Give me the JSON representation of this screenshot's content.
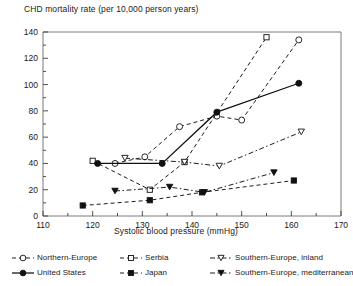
{
  "chart_data": {
    "type": "line",
    "title": "CHD mortality rate (per 10,000 person years)",
    "xlabel": "Systolic blood pressure (mmHg)",
    "ylabel": "CHD mortality rate (per 10,000 person years)",
    "xlim": [
      110,
      170
    ],
    "ylim": [
      0,
      140
    ],
    "xticks": [
      110,
      120,
      130,
      140,
      150,
      160,
      170
    ],
    "yticks": [
      0,
      20,
      40,
      60,
      80,
      100,
      120,
      140
    ],
    "x_minor_step": 5,
    "y_minor_step": 10,
    "grid": false,
    "legend_position": "bottom",
    "legend_columns": 3,
    "series": [
      {
        "name": "Northern-Europe",
        "marker": "open-circle",
        "line": "dashed",
        "points": [
          {
            "x": 124.5,
            "y": 40
          },
          {
            "x": 130.5,
            "y": 45
          },
          {
            "x": 137.5,
            "y": 68
          },
          {
            "x": 145.0,
            "y": 76
          },
          {
            "x": 150.0,
            "y": 73
          },
          {
            "x": 161.5,
            "y": 134
          }
        ]
      },
      {
        "name": "Serbia",
        "marker": "open-square",
        "line": "dashed",
        "points": [
          {
            "x": 120.0,
            "y": 42
          },
          {
            "x": 131.5,
            "y": 20
          },
          {
            "x": 138.5,
            "y": 41
          },
          {
            "x": 155.0,
            "y": 136
          }
        ]
      },
      {
        "name": "Southern-Europe, inland",
        "marker": "open-triangle-down",
        "line": "dash-dot",
        "points": [
          {
            "x": 126.5,
            "y": 44
          },
          {
            "x": 138.5,
            "y": 41
          },
          {
            "x": 145.5,
            "y": 38
          },
          {
            "x": 162.0,
            "y": 64
          }
        ]
      },
      {
        "name": "United States",
        "marker": "filled-circle",
        "line": "solid",
        "points": [
          {
            "x": 121.0,
            "y": 40
          },
          {
            "x": 134.0,
            "y": 40
          },
          {
            "x": 145.0,
            "y": 79
          },
          {
            "x": 161.5,
            "y": 101
          }
        ]
      },
      {
        "name": "Japan",
        "marker": "filled-square",
        "line": "dashed",
        "points": [
          {
            "x": 118.0,
            "y": 8
          },
          {
            "x": 131.5,
            "y": 12
          },
          {
            "x": 142.0,
            "y": 18
          },
          {
            "x": 160.5,
            "y": 27
          }
        ]
      },
      {
        "name": "Southern-Europe, mediterranean",
        "marker": "filled-triangle-down",
        "line": "dash-dot",
        "points": [
          {
            "x": 124.5,
            "y": 19
          },
          {
            "x": 135.5,
            "y": 22
          },
          {
            "x": 142.5,
            "y": 18
          },
          {
            "x": 156.5,
            "y": 33
          }
        ]
      }
    ]
  },
  "legend": {
    "items": [
      {
        "label": "Northern-Europe",
        "marker": "open-circle",
        "line": "dashed"
      },
      {
        "label": "Serbia",
        "marker": "open-square",
        "line": "dashed"
      },
      {
        "label": "Southern-Europe, inland",
        "marker": "open-triangle-down",
        "line": "dash-dot"
      },
      {
        "label": "United States",
        "marker": "filled-circle",
        "line": "solid"
      },
      {
        "label": "Japan",
        "marker": "filled-square",
        "line": "dashed"
      },
      {
        "label": "Southern-Europe, mediterranean",
        "marker": "filled-triangle-down",
        "line": "dash-dot"
      }
    ]
  },
  "colors": {
    "ink": "#1a1a1a",
    "axis": "#555555",
    "background": "#ffffff"
  }
}
